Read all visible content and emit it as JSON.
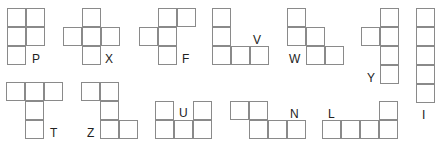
{
  "cell_size": 19,
  "line_color": "#8a8a8a",
  "pieces": [
    {
      "name": "P",
      "origin": [
        7,
        8
      ],
      "cells": [
        [
          0,
          0
        ],
        [
          1,
          0
        ],
        [
          0,
          1
        ],
        [
          1,
          1
        ],
        [
          0,
          2
        ]
      ],
      "label_pos": [
        32,
        53
      ]
    },
    {
      "name": "X",
      "origin": [
        63,
        8
      ],
      "cells": [
        [
          1,
          0
        ],
        [
          0,
          1
        ],
        [
          1,
          1
        ],
        [
          2,
          1
        ],
        [
          1,
          2
        ]
      ],
      "label_pos": [
        105,
        53
      ]
    },
    {
      "name": "F",
      "origin": [
        139,
        8
      ],
      "cells": [
        [
          1,
          0
        ],
        [
          2,
          0
        ],
        [
          0,
          1
        ],
        [
          1,
          1
        ],
        [
          1,
          2
        ]
      ],
      "label_pos": [
        182,
        53
      ]
    },
    {
      "name": "V",
      "origin": [
        212,
        8
      ],
      "cells": [
        [
          0,
          0
        ],
        [
          0,
          1
        ],
        [
          0,
          2
        ],
        [
          1,
          2
        ],
        [
          2,
          2
        ]
      ],
      "label_pos": [
        253,
        34
      ]
    },
    {
      "name": "W",
      "origin": [
        287,
        8
      ],
      "cells": [
        [
          0,
          0
        ],
        [
          0,
          1
        ],
        [
          1,
          1
        ],
        [
          1,
          2
        ],
        [
          2,
          2
        ]
      ],
      "label_pos": [
        289,
        53
      ]
    },
    {
      "name": "Y",
      "origin": [
        361,
        8
      ],
      "cells": [
        [
          1,
          0
        ],
        [
          0,
          1
        ],
        [
          1,
          1
        ],
        [
          1,
          2
        ],
        [
          1,
          3
        ]
      ],
      "label_pos": [
        367,
        72
      ]
    },
    {
      "name": "I",
      "origin": [
        416,
        8
      ],
      "cells": [
        [
          0,
          0
        ],
        [
          0,
          1
        ],
        [
          0,
          2
        ],
        [
          0,
          3
        ],
        [
          0,
          4
        ]
      ],
      "label_pos": [
        422,
        109
      ]
    },
    {
      "name": "T",
      "origin": [
        6,
        82
      ],
      "cells": [
        [
          0,
          0
        ],
        [
          1,
          0
        ],
        [
          2,
          0
        ],
        [
          1,
          1
        ],
        [
          1,
          2
        ]
      ],
      "label_pos": [
        50,
        127
      ]
    },
    {
      "name": "Z",
      "origin": [
        81,
        82
      ],
      "cells": [
        [
          0,
          0
        ],
        [
          1,
          0
        ],
        [
          1,
          1
        ],
        [
          1,
          2
        ],
        [
          2,
          2
        ]
      ],
      "label_pos": [
        87,
        127
      ]
    },
    {
      "name": "U",
      "origin": [
        155,
        101
      ],
      "cells": [
        [
          0,
          0
        ],
        [
          2,
          0
        ],
        [
          0,
          1
        ],
        [
          1,
          1
        ],
        [
          2,
          1
        ]
      ],
      "label_pos": [
        179,
        107
      ]
    },
    {
      "name": "N",
      "origin": [
        230,
        101
      ],
      "cells": [
        [
          0,
          0
        ],
        [
          1,
          0
        ],
        [
          1,
          1
        ],
        [
          2,
          1
        ],
        [
          3,
          1
        ]
      ],
      "label_pos": [
        290,
        108
      ]
    },
    {
      "name": "L",
      "origin": [
        322,
        101
      ],
      "cells": [
        [
          3,
          0
        ],
        [
          0,
          1
        ],
        [
          1,
          1
        ],
        [
          2,
          1
        ],
        [
          3,
          1
        ]
      ],
      "label_pos": [
        328,
        108
      ]
    }
  ]
}
